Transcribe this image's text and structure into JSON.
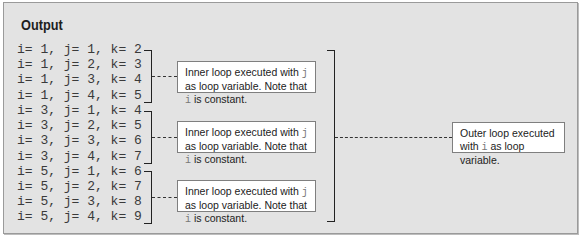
{
  "title": "Output",
  "output_lines": [
    "i= 1, j= 1, k= 2",
    "i= 1, j= 2, k= 3",
    "i= 1, j= 3, k= 4",
    "i= 1, j= 4, k= 5",
    "i= 3, j= 1, k= 4",
    "i= 3, j= 2, k= 5",
    "i= 3, j= 3, k= 6",
    "i= 3, j= 4, k= 7",
    "i= 5, j= 1, k= 6",
    "i= 5, j= 2, k= 7",
    "i= 5, j= 3, k= 8",
    "i= 5, j= 4, k= 9"
  ],
  "inner_notes": [
    {
      "pre": "Inner loop executed with ",
      "var": "j",
      "mid": " as loop variable. Note that ",
      "var2": "i",
      "post": " is constant."
    },
    {
      "pre": "Inner loop executed with ",
      "var": "j",
      "mid": " as loop variable. Note that ",
      "var2": "i",
      "post": " is constant."
    },
    {
      "pre": "Inner loop executed with ",
      "var": "j",
      "mid": " as loop variable. Note that ",
      "var2": "i",
      "post": " is constant."
    }
  ],
  "outer_note": {
    "pre": "Outer loop executed with ",
    "var": "i",
    "post": " as loop variable."
  }
}
